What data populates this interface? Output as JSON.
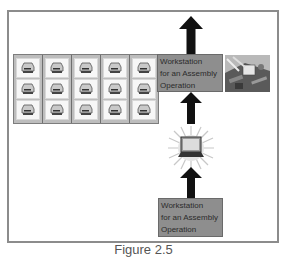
{
  "diagram": {
    "top_box": {
      "lines": [
        "Workstation",
        "for an Assembly",
        "Operation"
      ]
    },
    "bottom_box": {
      "lines": [
        "Workstation",
        "for an Assembly",
        "Operation"
      ]
    },
    "grid": {
      "columns": 5,
      "rows": 3,
      "cell_icon": "hard-drive-icon"
    },
    "icons": {
      "photo": "circuit-board-photo",
      "center": "laptop-starburst-icon",
      "arrows": [
        "arrow-up-top",
        "arrow-up-middle",
        "arrow-up-bottom"
      ]
    },
    "caption": "Figure 2.5",
    "colors": {
      "box_fill": "#8e8e8e",
      "frame": "#8c8c8c",
      "arrow": "#111111"
    }
  }
}
